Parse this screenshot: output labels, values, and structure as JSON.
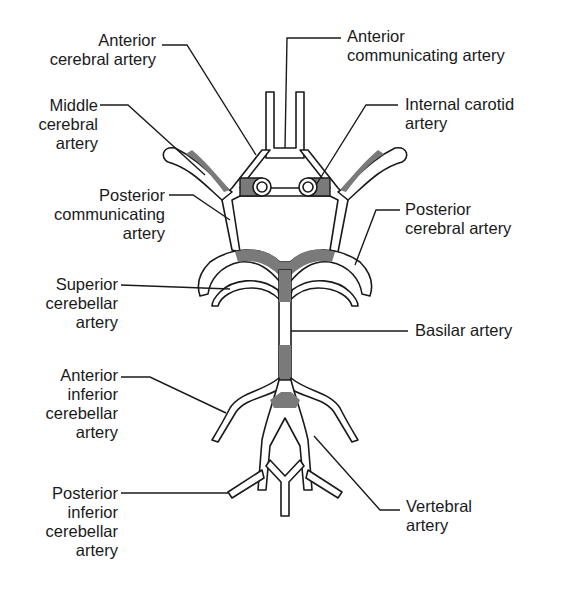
{
  "diagram": {
    "shade_color": "#7a7a7a",
    "line_color": "#1a1a1a",
    "labels": {
      "anterior_cerebral": "Anterior\ncerebral artery",
      "anterior_communicating": "Anterior\ncommunicating artery",
      "middle_cerebral": "Middle\ncerebral\nartery",
      "internal_carotid": "Internal carotid\nartery",
      "posterior_communicating": "Posterior\ncommunicating\nartery",
      "posterior_cerebral": "Posterior\ncerebral artery",
      "superior_cerebellar": "Superior\ncerebellar\nartery",
      "basilar": "Basilar artery",
      "anterior_inferior_cerebellar": "Anterior\ninferior\ncerebellar\nartery",
      "posterior_inferior_cerebellar": "Posterior\ninferior\ncerebellar\nartery",
      "vertebral": "Vertebral\nartery"
    }
  }
}
